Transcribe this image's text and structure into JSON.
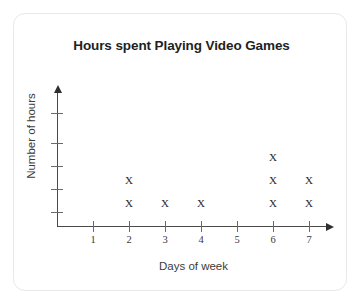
{
  "card": {
    "border_color": "#e8e8e8",
    "background": "#ffffff"
  },
  "chart_data": {
    "type": "scatter",
    "plot_style": "dot-plot",
    "title": "Hours spent Playing Video Games",
    "xlabel": "Days of week",
    "ylabel": "Number of hours",
    "marker": "X",
    "marker_color": "#2b2b2b",
    "axis_color": "#4a4a4a",
    "grid": false,
    "legend": null,
    "categories": [
      "1",
      "2",
      "3",
      "4",
      "5",
      "6",
      "7"
    ],
    "x": [
      1,
      2,
      3,
      4,
      5,
      6,
      7
    ],
    "values": [
      0,
      2,
      1,
      1,
      0,
      3,
      2
    ],
    "xlim": [
      0,
      7.6
    ],
    "ylim": [
      0,
      5
    ],
    "x_tick_labels": [
      "1",
      "2",
      "3",
      "4",
      "5",
      "6",
      "7"
    ],
    "y_tick_labels": [
      "",
      "",
      "",
      "",
      ""
    ],
    "y_tick_count": 5,
    "points": [
      {
        "x": 2,
        "y": 1
      },
      {
        "x": 2,
        "y": 2
      },
      {
        "x": 3,
        "y": 1
      },
      {
        "x": 4,
        "y": 1
      },
      {
        "x": 6,
        "y": 1
      },
      {
        "x": 6,
        "y": 2
      },
      {
        "x": 6,
        "y": 3
      },
      {
        "x": 7,
        "y": 1
      },
      {
        "x": 7,
        "y": 2
      }
    ]
  }
}
